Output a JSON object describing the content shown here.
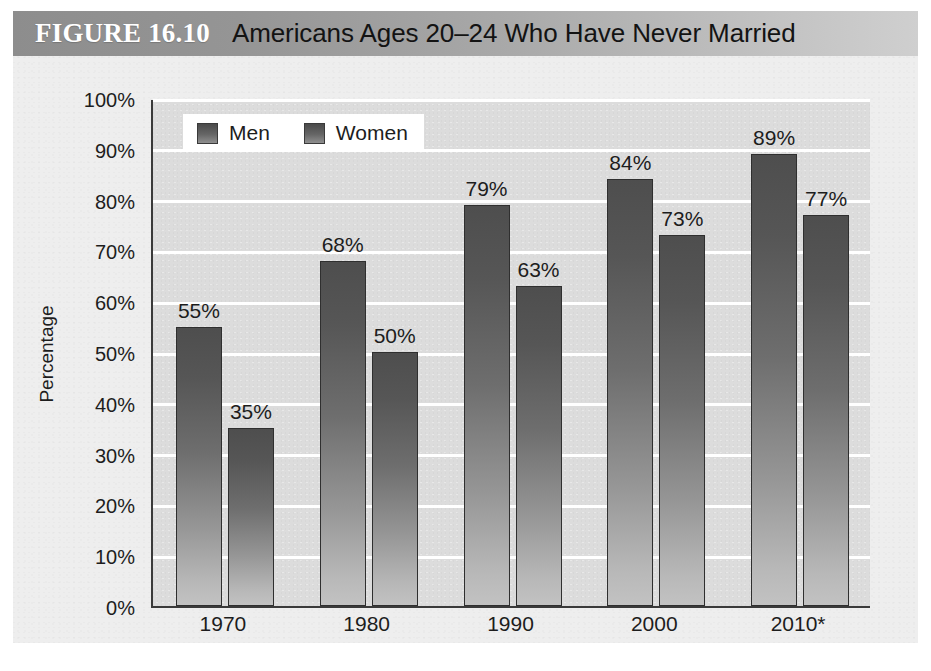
{
  "figure": {
    "number_label": "FIGURE 16.10",
    "title": "Americans Ages 20–24 Who Have Never Married"
  },
  "chart_data": {
    "type": "bar",
    "title": "Americans Ages 20–24 Who Have Never Married",
    "xlabel": "",
    "ylabel": "Percentage",
    "ylim": [
      0,
      100
    ],
    "grid": true,
    "legend_position": "top-left",
    "categories": [
      "1970",
      "1980",
      "1990",
      "2000",
      "2010*"
    ],
    "series": [
      {
        "name": "Men",
        "values": [
          55,
          68,
          79,
          84,
          89
        ],
        "labels": [
          "55%",
          "68%",
          "79%",
          "84%",
          "89%"
        ]
      },
      {
        "name": "Women",
        "values": [
          35,
          50,
          63,
          73,
          77
        ],
        "labels": [
          "35%",
          "50%",
          "63%",
          "73%",
          "77%"
        ]
      }
    ],
    "ytick_labels": [
      "100%",
      "90%",
      "80%",
      "70%",
      "60%",
      "50%",
      "40%",
      "30%",
      "20%",
      "10%",
      "0%"
    ],
    "ytick_values": [
      100,
      90,
      80,
      70,
      60,
      50,
      40,
      30,
      20,
      10,
      0
    ]
  },
  "colors": {
    "titlebar_left": "#8d8d8d",
    "titlebar_right": "#cfcfcf",
    "panel_bg": "#eeeeee",
    "plot_bg": "#dcdcdc",
    "gridline": "#ffffff",
    "bar_top": "#4e4e4e",
    "bar_bottom": "#c2c2c2",
    "axis": "#3a3a3a",
    "text": "#1d1d1d",
    "figure_number_text": "#ffffff"
  }
}
